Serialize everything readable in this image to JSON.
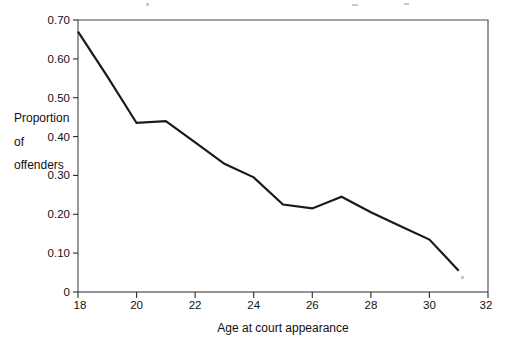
{
  "chart_data": {
    "type": "line",
    "title": "",
    "xlabel": "Age at court appearance",
    "ylabel": "Proportion of offenders",
    "ylabel_lines": [
      "Proportion",
      "of",
      "offenders"
    ],
    "x": [
      18,
      19,
      20,
      21,
      22,
      23,
      24,
      25,
      26,
      27,
      28,
      29,
      30,
      31
    ],
    "values": [
      0.67,
      0.555,
      0.435,
      0.44,
      0.385,
      0.33,
      0.295,
      0.225,
      0.215,
      0.245,
      0.205,
      0.17,
      0.135,
      0.055
    ],
    "series": [
      {
        "name": "Proportion of offenders",
        "values": [
          0.67,
          0.555,
          0.435,
          0.44,
          0.385,
          0.33,
          0.295,
          0.225,
          0.215,
          0.245,
          0.205,
          0.17,
          0.135,
          0.055
        ]
      }
    ],
    "xlim": [
      18,
      32
    ],
    "ylim": [
      0,
      0.7
    ],
    "xticks": [
      18,
      20,
      22,
      24,
      26,
      28,
      30,
      32
    ],
    "xtick_labels": [
      "18",
      "20",
      "22",
      "24",
      "26",
      "28",
      "30",
      "32"
    ],
    "yticks": [
      0,
      0.1,
      0.2,
      0.3,
      0.4,
      0.5,
      0.6,
      0.7
    ],
    "ytick_labels": [
      "0",
      "0.10",
      "0.20",
      "0.30",
      "0.40",
      "0.50",
      "0.60",
      "0.70"
    ],
    "grid": false,
    "legend": null,
    "line_color": "#1a1a1a",
    "axis_color": "#2b2b2b"
  }
}
